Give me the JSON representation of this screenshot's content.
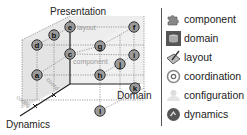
{
  "diagram": {
    "axes": {
      "vertical": "Presentation",
      "horizontal": "Domain",
      "depth": "Dynamics"
    },
    "face_labels": {
      "top": "layout",
      "middle": "component",
      "depth_1": "config",
      "depth_2": "coord"
    },
    "nodes": [
      {
        "id": "a",
        "x": 37,
        "y": 75
      },
      {
        "id": "b",
        "x": 54,
        "y": 35
      },
      {
        "id": "c",
        "x": 70,
        "y": 54
      },
      {
        "id": "d",
        "x": 37,
        "y": 45
      },
      {
        "id": "e",
        "x": 70,
        "y": 27
      },
      {
        "id": "f",
        "x": 134,
        "y": 27
      },
      {
        "id": "g",
        "x": 100,
        "y": 46
      },
      {
        "id": "h",
        "x": 100,
        "y": 75
      },
      {
        "id": "i",
        "x": 134,
        "y": 55
      },
      {
        "id": "j",
        "x": 120,
        "y": 64
      },
      {
        "id": "k",
        "x": 135,
        "y": 88
      },
      {
        "id": "l",
        "x": 100,
        "y": 111
      }
    ]
  },
  "legend": {
    "items": [
      {
        "label": "component",
        "icon": "puzzle-icon"
      },
      {
        "label": "domain",
        "icon": "database-icon"
      },
      {
        "label": "layout",
        "icon": "layout-icon"
      },
      {
        "label": "coordination",
        "icon": "coordination-icon"
      },
      {
        "label": "configuration",
        "icon": "configuration-icon"
      },
      {
        "label": "dynamics",
        "icon": "dynamics-icon"
      }
    ]
  }
}
